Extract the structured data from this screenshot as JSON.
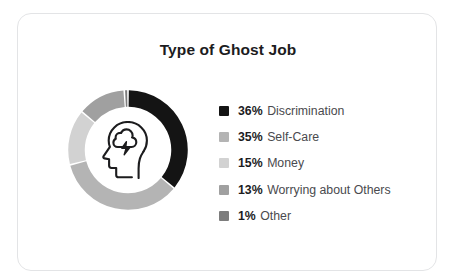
{
  "card": {
    "title": "Type of Ghost Job",
    "border_color": "#e3e4e6",
    "background": "#ffffff"
  },
  "center_icon": {
    "name": "head-with-brainstorm-icon",
    "stroke_color": "#1c1c1e"
  },
  "chart_data": {
    "type": "pie",
    "variant": "donut",
    "title": "Type of Ghost Job",
    "xlabel": "",
    "ylabel": "",
    "legend_position": "right",
    "grid": false,
    "units": "percent",
    "start_angle_deg": 0,
    "direction": "clockwise",
    "categories": [
      "Discrimination",
      "Self-Care",
      "Money",
      "Worrying about Others",
      "Other"
    ],
    "values": [
      36,
      35,
      15,
      13,
      1
    ],
    "value_labels": [
      "36%",
      "35%",
      "15%",
      "13%",
      "1%"
    ],
    "colors": [
      "#141414",
      "#b4b4b4",
      "#d2d2d2",
      "#a0a0a0",
      "#7d7d7d"
    ],
    "slices": [
      {
        "label": "Discrimination",
        "value": 36,
        "value_label": "36%",
        "color": "#141414"
      },
      {
        "label": "Self-Care",
        "value": 35,
        "value_label": "35%",
        "color": "#b4b4b4"
      },
      {
        "label": "Money",
        "value": 15,
        "value_label": "15%",
        "color": "#d2d2d2"
      },
      {
        "label": "Worrying about Others",
        "value": 13,
        "value_label": "13%",
        "color": "#a0a0a0"
      },
      {
        "label": "Other",
        "value": 1,
        "value_label": "1%",
        "color": "#7d7d7d"
      }
    ]
  }
}
